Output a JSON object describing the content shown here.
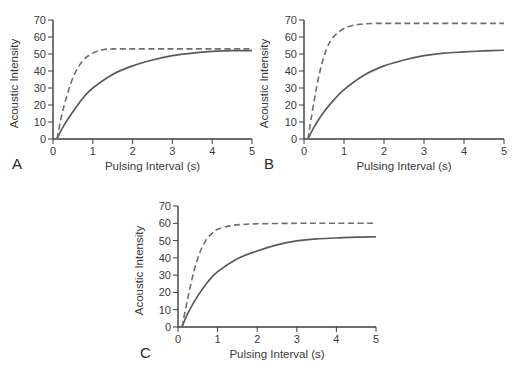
{
  "chart_data": [
    {
      "type": "line",
      "panel_label": "A",
      "xlabel": "Pulsing Interval (s)",
      "ylabel": "Acoustic Intensity",
      "xlim": [
        0,
        5
      ],
      "ylim": [
        0,
        70
      ],
      "xticks": [
        "0",
        "1",
        "2",
        "3",
        "4",
        "5"
      ],
      "yticks": [
        "0",
        "10",
        "20",
        "30",
        "40",
        "50",
        "60",
        "70"
      ],
      "grid": false,
      "legend": null,
      "series": [
        {
          "name": "solid",
          "style": "solid",
          "x": [
            0.1,
            0.25,
            0.5,
            0.75,
            1.0,
            1.5,
            2.0,
            2.5,
            3.0,
            3.5,
            4.0,
            4.5,
            5.0
          ],
          "y": [
            0,
            7,
            16,
            24,
            30,
            38,
            43,
            46.5,
            49,
            50.5,
            51.5,
            52,
            52
          ]
        },
        {
          "name": "dashed",
          "style": "dashed",
          "x": [
            0.1,
            0.25,
            0.5,
            0.75,
            1.0,
            1.25,
            1.5,
            2.0,
            3.0,
            4.0,
            5.0
          ],
          "y": [
            0,
            17,
            36,
            46,
            50.5,
            52.5,
            53,
            53,
            53,
            53,
            53
          ]
        }
      ]
    },
    {
      "type": "line",
      "panel_label": "B",
      "xlabel": "Pulsing Interval (s)",
      "ylabel": "Acoustic Intensity",
      "xlim": [
        0,
        5
      ],
      "ylim": [
        0,
        70
      ],
      "xticks": [
        "0",
        "1",
        "2",
        "3",
        "4",
        "5"
      ],
      "yticks": [
        "0",
        "10",
        "20",
        "30",
        "40",
        "50",
        "60",
        "70"
      ],
      "grid": false,
      "legend": null,
      "series": [
        {
          "name": "solid",
          "style": "solid",
          "x": [
            0.1,
            0.25,
            0.5,
            0.75,
            1.0,
            1.5,
            2.0,
            2.5,
            3.0,
            3.5,
            4.0,
            4.5,
            5.0
          ],
          "y": [
            0,
            7,
            16,
            23,
            29,
            37.5,
            43,
            46.5,
            49,
            50.5,
            51.2,
            51.8,
            52.2
          ]
        },
        {
          "name": "dashed",
          "style": "dashed",
          "x": [
            0.1,
            0.25,
            0.4,
            0.55,
            0.7,
            0.9,
            1.1,
            1.4,
            1.8,
            2.5,
            3.0,
            4.0,
            5.0
          ],
          "y": [
            0,
            22,
            40,
            52,
            59,
            63.5,
            66,
            67.5,
            68,
            68,
            68,
            68,
            68
          ]
        }
      ]
    },
    {
      "type": "line",
      "panel_label": "C",
      "xlabel": "Pulsing Interval (s)",
      "ylabel": "Acoustic Intensity",
      "xlim": [
        0,
        5
      ],
      "ylim": [
        0,
        70
      ],
      "xticks": [
        "0",
        "1",
        "2",
        "3",
        "4",
        "5"
      ],
      "yticks": [
        "0",
        "10",
        "20",
        "30",
        "40",
        "50",
        "60",
        "70"
      ],
      "grid": false,
      "legend": null,
      "series": [
        {
          "name": "solid",
          "style": "solid",
          "x": [
            0.1,
            0.25,
            0.5,
            0.75,
            1.0,
            1.5,
            2.0,
            2.5,
            3.0,
            3.5,
            4.0,
            4.5,
            5.0
          ],
          "y": [
            0,
            8,
            18,
            26,
            32,
            39.5,
            44,
            47.5,
            49.8,
            51,
            51.5,
            52,
            52.2
          ]
        },
        {
          "name": "dashed",
          "style": "dashed",
          "x": [
            0.1,
            0.25,
            0.4,
            0.55,
            0.7,
            0.85,
            1.0,
            1.3,
            1.6,
            2.0,
            3.0,
            4.0,
            5.0
          ],
          "y": [
            0,
            17,
            32,
            43,
            50,
            54,
            56.5,
            58.5,
            59.3,
            59.7,
            60,
            60,
            60
          ]
        }
      ]
    }
  ],
  "colors": {
    "axis": "#3c3c3c",
    "solid_line": "#5a5a5a",
    "dashed_line": "#6e6e6e",
    "text": "#3a3a3a"
  },
  "layout": {
    "panels": [
      {
        "x0": 53,
        "x1": 252,
        "y0": 139,
        "y1": 20,
        "label_x": 12,
        "label_y": 169,
        "ylabel_x": 18
      },
      {
        "x0": 304,
        "x1": 504,
        "y0": 139,
        "y1": 20,
        "label_x": 264,
        "label_y": 169,
        "ylabel_x": 268
      },
      {
        "x0": 178,
        "x1": 376,
        "y0": 327,
        "y1": 206,
        "label_x": 140,
        "label_y": 358,
        "ylabel_x": 143
      }
    ]
  }
}
